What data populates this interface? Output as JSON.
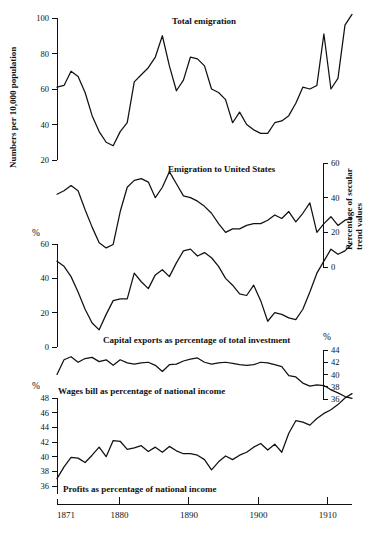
{
  "figure": {
    "title": "",
    "x_axis": {
      "label": "",
      "range": [
        1871,
        1913
      ],
      "tick_labels": [
        "1871",
        "1880",
        "1890",
        "1900",
        "1910"
      ],
      "tick_values": [
        1871,
        1880,
        1890,
        1900,
        1910
      ]
    }
  },
  "panels": [
    {
      "id": "total-emigration",
      "caption": "Total emigration",
      "y_axis_label": "Numbers per 10,000 population",
      "y_axis_side": "left",
      "percent_symbol": "",
      "tick_labels": [
        "20",
        "40",
        "60",
        "80",
        "100"
      ],
      "ylim": [
        20,
        105
      ]
    },
    {
      "id": "emigration-united-states",
      "caption": "Emigration to United States",
      "y_axis_label": "Percentage of secular trend values",
      "y_axis_side": "right",
      "percent_symbol": "",
      "tick_labels": [
        "0",
        "20",
        "40",
        "60"
      ],
      "ylim": [
        0,
        62
      ]
    },
    {
      "id": "capital-exports",
      "caption": "Capital exports as percentage of total investment",
      "y_axis_label": "",
      "y_axis_side": "left",
      "percent_symbol": "%",
      "tick_labels": [
        "0",
        "20",
        "40",
        "60"
      ],
      "ylim": [
        0,
        62
      ]
    },
    {
      "id": "wages-bill",
      "caption": "Wages bill as percentage of national income",
      "y_axis_label": "",
      "y_axis_side": "right",
      "percent_symbol": "%",
      "tick_labels": [
        "36",
        "38",
        "40",
        "42",
        "44"
      ],
      "ylim": [
        35,
        44.5
      ]
    },
    {
      "id": "profits",
      "caption": "Profits as percentage of national income",
      "y_axis_label": "",
      "y_axis_side": "left",
      "percent_symbol": "%",
      "tick_labels": [
        "36",
        "38",
        "40",
        "42",
        "44",
        "46",
        "48"
      ],
      "ylim": [
        35,
        48.5
      ]
    }
  ],
  "chart_data": [
    {
      "type": "line",
      "id": "total-emigration",
      "title": "Total emigration",
      "xlabel": "",
      "ylabel": "Numbers per 10,000 population",
      "xlim": [
        1871,
        1913
      ],
      "ylim": [
        20,
        105
      ],
      "grid": false,
      "legend": "none",
      "x": [
        1871,
        1872,
        1873,
        1874,
        1875,
        1876,
        1877,
        1878,
        1879,
        1880,
        1881,
        1882,
        1883,
        1884,
        1885,
        1886,
        1887,
        1888,
        1889,
        1890,
        1891,
        1892,
        1893,
        1894,
        1895,
        1896,
        1897,
        1898,
        1899,
        1900,
        1901,
        1902,
        1903,
        1904,
        1905,
        1906,
        1907,
        1908,
        1909,
        1910,
        1911,
        1912,
        1913
      ],
      "values": [
        61,
        62,
        70,
        67,
        58,
        45,
        36,
        30,
        28,
        36,
        41,
        64,
        68,
        72,
        78,
        90,
        73,
        59,
        65,
        78,
        77,
        73,
        60,
        58,
        54,
        41,
        47,
        40,
        37,
        35,
        35,
        41,
        42,
        45,
        52,
        61,
        60,
        62,
        91,
        60,
        66,
        96,
        102,
        103
      ]
    },
    {
      "type": "line",
      "id": "emigration-united-states",
      "title": "Emigration to United States",
      "xlabel": "",
      "ylabel": "Percentage of secular trend values",
      "xlim": [
        1871,
        1913
      ],
      "ylim": [
        0,
        62
      ],
      "grid": false,
      "legend": "none",
      "x": [
        1871,
        1872,
        1873,
        1874,
        1875,
        1876,
        1877,
        1878,
        1879,
        1880,
        1881,
        1882,
        1883,
        1884,
        1885,
        1886,
        1887,
        1888,
        1889,
        1890,
        1891,
        1892,
        1893,
        1894,
        1895,
        1896,
        1897,
        1898,
        1899,
        1900,
        1901,
        1902,
        1903,
        1904,
        1905,
        1906,
        1907,
        1908,
        1909,
        1910,
        1911,
        1912,
        1913
      ],
      "values": [
        42,
        44,
        47,
        44,
        33,
        23,
        14,
        11,
        13,
        32,
        46,
        50,
        51,
        49,
        40,
        46,
        55,
        48,
        41,
        40,
        38,
        35,
        31,
        25,
        20,
        22,
        22,
        24,
        25,
        25,
        27,
        30,
        28,
        32,
        26,
        31,
        37,
        20,
        25,
        29,
        24,
        27,
        28
      ]
    },
    {
      "type": "line",
      "id": "capital-exports",
      "title": "Capital exports as percentage of total investment",
      "xlabel": "",
      "ylabel": "",
      "xlim": [
        1871,
        1913
      ],
      "ylim": [
        0,
        62
      ],
      "grid": false,
      "legend": "none",
      "x": [
        1871,
        1872,
        1873,
        1874,
        1875,
        1876,
        1877,
        1878,
        1879,
        1880,
        1881,
        1882,
        1883,
        1884,
        1885,
        1886,
        1887,
        1888,
        1889,
        1890,
        1891,
        1892,
        1893,
        1894,
        1895,
        1896,
        1897,
        1898,
        1899,
        1900,
        1901,
        1902,
        1903,
        1904,
        1905,
        1906,
        1907,
        1908,
        1909,
        1910,
        1911,
        1912,
        1913
      ],
      "values": [
        50,
        47,
        41,
        32,
        22,
        14,
        10,
        19,
        27,
        28,
        28,
        43,
        38,
        34,
        42,
        45,
        41,
        49,
        56,
        57,
        53,
        55,
        52,
        47,
        40,
        36,
        31,
        30,
        36,
        27,
        15,
        20,
        19,
        17,
        16,
        22,
        32,
        43,
        50,
        57,
        54,
        56,
        60,
        58
      ]
    },
    {
      "type": "line",
      "id": "wages-bill",
      "title": "Wages bill as percentage of national income",
      "xlabel": "",
      "ylabel": "",
      "xlim": [
        1871,
        1913
      ],
      "ylim": [
        35,
        44.5
      ],
      "grid": false,
      "legend": "none",
      "x": [
        1871,
        1872,
        1873,
        1874,
        1875,
        1876,
        1877,
        1878,
        1879,
        1880,
        1881,
        1882,
        1883,
        1884,
        1885,
        1886,
        1887,
        1888,
        1889,
        1890,
        1891,
        1892,
        1893,
        1894,
        1895,
        1896,
        1897,
        1898,
        1899,
        1900,
        1901,
        1902,
        1903,
        1904,
        1905,
        1906,
        1907,
        1908,
        1909,
        1910,
        1911,
        1912,
        1913
      ],
      "values": [
        40.0,
        42.4,
        42.9,
        42.0,
        42.6,
        42.8,
        42.1,
        42.4,
        41.5,
        42.4,
        41.9,
        41.7,
        41.9,
        42.0,
        41.5,
        40.5,
        41.6,
        41.7,
        42.2,
        42.5,
        42.7,
        42.0,
        41.7,
        41.9,
        42.0,
        41.8,
        41.6,
        41.5,
        41.6,
        42.0,
        41.9,
        41.6,
        41.3,
        39.8,
        39.6,
        38.6,
        38.1,
        38.3,
        38.2,
        37.5,
        37.0,
        36.4,
        36.1
      ]
    },
    {
      "type": "line",
      "id": "profits",
      "title": "Profits as percentage of national income",
      "xlabel": "",
      "ylabel": "",
      "xlim": [
        1871,
        1913
      ],
      "ylim": [
        35,
        48.5
      ],
      "grid": false,
      "legend": "none",
      "x": [
        1871,
        1872,
        1873,
        1874,
        1875,
        1876,
        1877,
        1878,
        1879,
        1880,
        1881,
        1882,
        1883,
        1884,
        1885,
        1886,
        1887,
        1888,
        1889,
        1890,
        1891,
        1892,
        1893,
        1894,
        1895,
        1896,
        1897,
        1898,
        1899,
        1900,
        1901,
        1902,
        1903,
        1904,
        1905,
        1906,
        1907,
        1908,
        1909,
        1910,
        1911,
        1912,
        1913
      ],
      "values": [
        37.0,
        38.6,
        39.9,
        39.8,
        39.2,
        40.2,
        41.3,
        40.0,
        42.2,
        42.1,
        41.0,
        41.2,
        41.5,
        40.7,
        41.3,
        40.6,
        41.4,
        40.8,
        40.4,
        40.4,
        40.2,
        39.6,
        38.2,
        39.3,
        40.1,
        39.6,
        40.2,
        40.6,
        41.3,
        41.8,
        40.9,
        41.7,
        40.6,
        43.2,
        44.9,
        44.7,
        44.3,
        45.2,
        45.9,
        46.4,
        47.1,
        48.0,
        48.6
      ]
    }
  ]
}
